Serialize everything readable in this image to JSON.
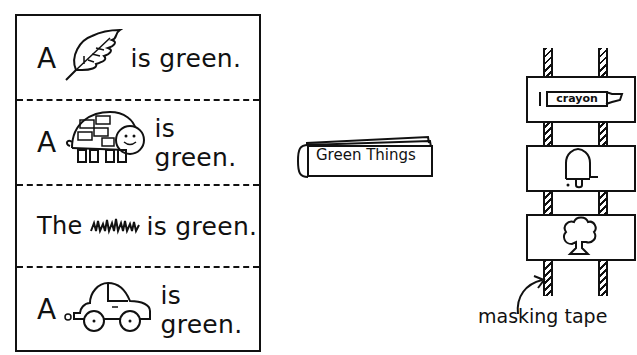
{
  "sentence_strips": [
    {
      "prefix": "A",
      "picture": "leaf",
      "suffix": "is green."
    },
    {
      "prefix": "A",
      "picture": "turtle",
      "suffix": "is green."
    },
    {
      "prefix": "The",
      "picture": "grass",
      "suffix": "is green."
    },
    {
      "prefix": "A",
      "picture": "car",
      "suffix": "is green."
    }
  ],
  "booklet": {
    "title": "Green Things"
  },
  "ladder": {
    "cards": [
      {
        "picture": "crayon",
        "label": "crayon"
      },
      {
        "picture": "bell",
        "label": ""
      },
      {
        "picture": "tree",
        "label": ""
      }
    ],
    "caption": "masking tape"
  },
  "colors": {
    "ink": "#111111",
    "paper": "#ffffff"
  }
}
